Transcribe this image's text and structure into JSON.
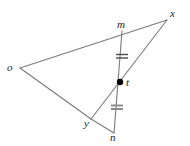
{
  "figure": {
    "type": "geometry-diagram",
    "background_color": "#ffffff",
    "stroke_color": "#7a7a7a",
    "label_color": "#1c1c1c",
    "tick_color_upper": "#4a4a4a",
    "tick_color_lower": "#8c8c8c",
    "point_fill_color": "#000000",
    "width": 190,
    "height": 146
  },
  "points": [
    {
      "id": "o",
      "label": "o",
      "x": 20,
      "y": 68,
      "label_x": 7,
      "label_y": 62,
      "marked": false
    },
    {
      "id": "x",
      "label": "x",
      "x": 167,
      "y": 20,
      "label_x": 170,
      "label_y": 8,
      "marked": false
    },
    {
      "id": "m",
      "label": "m",
      "x": 122,
      "y": 31,
      "label_x": 117,
      "label_y": 19,
      "marked": false
    },
    {
      "id": "t",
      "label": "t",
      "x": 120,
      "y": 82,
      "label_x": 126,
      "label_y": 77,
      "marked": true
    },
    {
      "id": "y",
      "label": "y",
      "x": 91,
      "y": 119,
      "label_x": 84,
      "label_y": 118,
      "marked": false
    },
    {
      "id": "n",
      "label": "n",
      "x": 114,
      "y": 133,
      "label_x": 110,
      "label_y": 132,
      "marked": false
    }
  ],
  "segments": [
    {
      "id": "o-x",
      "from": "o",
      "to": "x",
      "x1": 20,
      "y1": 68,
      "x2": 167,
      "y2": 20
    },
    {
      "id": "o-y",
      "from": "o",
      "to": "y",
      "x1": 20,
      "y1": 68,
      "x2": 91,
      "y2": 119
    },
    {
      "id": "y-x",
      "from": "y",
      "to": "x",
      "x1": 91,
      "y1": 119,
      "x2": 167,
      "y2": 20
    },
    {
      "id": "m-n",
      "from": "m",
      "to": "n",
      "x1": 122,
      "y1": 31,
      "x2": 114,
      "y2": 133
    },
    {
      "id": "y-n",
      "from": "y",
      "to": "n",
      "x1": 91,
      "y1": 119,
      "x2": 114,
      "y2": 133
    }
  ],
  "tick_marks": [
    {
      "id": "tick-upper",
      "on_segment": "m-t",
      "count": 2,
      "cx": 122,
      "cy": 56,
      "half_width": 6,
      "gap": 3,
      "color": "#4a4a4a",
      "thickness": 1.4
    },
    {
      "id": "tick-lower",
      "on_segment": "t-n",
      "count": 2,
      "cx": 117,
      "cy": 107,
      "half_width": 6,
      "gap": 3,
      "color": "#8c8c8c",
      "thickness": 2.0
    }
  ],
  "point_marker": {
    "id": "t-dot",
    "cx": 120,
    "cy": 82,
    "r": 3.2
  }
}
